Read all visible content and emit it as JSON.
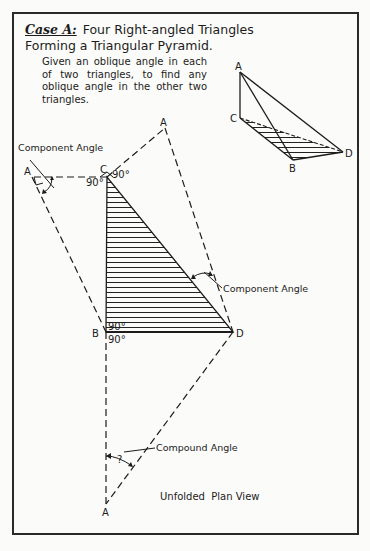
{
  "title": {
    "case_label": "Case A:",
    "text": "Four Right-angled Triangles Forming a Triangular Pyramid."
  },
  "description": "Given an oblique angle in each of two triangles, to find any oblique angle in the other two triangles.",
  "pyramid": {
    "vertices": {
      "A": "A",
      "B": "B",
      "C": "C",
      "D": "D"
    }
  },
  "plan_view": {
    "vertex_labels": {
      "A_top": "A",
      "A_left": "A",
      "A_bottom": "A",
      "B": "B",
      "C": "C",
      "D": "D"
    },
    "angle_labels": {
      "c_left": "90°",
      "c_right": "90°",
      "b_top": "90°",
      "b_bottom": "90°",
      "unknown": "?"
    },
    "annotations": {
      "component_angle_1": "Component Angle",
      "component_angle_2": "Component Angle",
      "compound_angle": "Compound Angle"
    },
    "caption": "Unfolded  Plan View"
  }
}
